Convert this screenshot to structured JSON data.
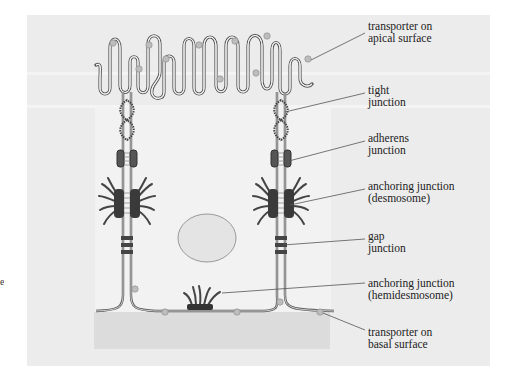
{
  "figure": {
    "edge_fragment": "e"
  },
  "labels": [
    {
      "id": "apical-transporter",
      "line1": "transporter on",
      "line2": "apical surface",
      "top": 20
    },
    {
      "id": "tight-junction",
      "line1": "tight",
      "line2": "junction",
      "top": 84
    },
    {
      "id": "adherens-junction",
      "line1": "adherens",
      "line2": "junction",
      "top": 132
    },
    {
      "id": "desmosome",
      "line1": "anchoring junction",
      "line2": "(desmosome)",
      "top": 180
    },
    {
      "id": "gap-junction",
      "line1": "gap",
      "line2": "junction",
      "top": 230
    },
    {
      "id": "hemidesmosome",
      "line1": "anchoring junction",
      "line2": "(hemidesmosome)",
      "top": 277
    },
    {
      "id": "basal-transporter",
      "line1": "transporter on",
      "line2": "basal surface",
      "top": 326
    }
  ],
  "colors": {
    "panel": "#ececec",
    "membrane": "#555555",
    "transporter": "#bdbdbd",
    "junction_dark": "#3a3a3a",
    "lamina": "#dcdcdc"
  }
}
